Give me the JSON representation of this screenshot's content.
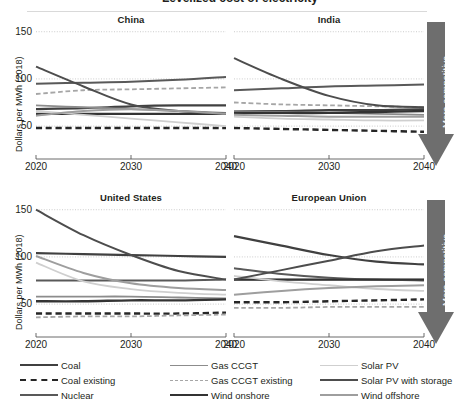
{
  "figure": {
    "partial_top_title": "Levelized cost of electricity",
    "ylabel": "Dollars per MWh (2018)",
    "arrow_label": "More competitive",
    "arrow_color": "#6e6e6e",
    "panel_titles": [
      "China",
      "India",
      "United States",
      "European Union"
    ]
  },
  "axes": {
    "ytick_labels": [
      "150",
      "100",
      "50"
    ],
    "yticks": [
      150,
      100,
      50
    ],
    "ylim": [
      30,
      155
    ],
    "xtick_labels": [
      "2020",
      "2030",
      "2040"
    ],
    "xticks": [
      2020,
      2030,
      2040
    ],
    "xlim": [
      2020,
      2040
    ]
  },
  "legend": {
    "columns": [
      [
        {
          "label": "Coal",
          "color": "#404040",
          "dash": false,
          "width": 2.2
        },
        {
          "label": "Coal existing",
          "color": "#262626",
          "dash": true,
          "width": 2.4
        },
        {
          "label": "Nuclear",
          "color": "#595959",
          "dash": false,
          "width": 2.0
        }
      ],
      [
        {
          "label": "Gas CCGT",
          "color": "#8c8c8c",
          "dash": false,
          "width": 1.8
        },
        {
          "label": "Gas CCGT existing",
          "color": "#a6a6a6",
          "dash": true,
          "width": 1.8
        },
        {
          "label": "Wind onshore",
          "color": "#333333",
          "dash": false,
          "width": 2.4
        }
      ],
      [
        {
          "label": "Solar PV",
          "color": "#cfcfcf",
          "dash": false,
          "width": 1.8
        },
        {
          "label": "Solar PV with storage",
          "color": "#4d4d4d",
          "dash": false,
          "width": 2.0
        },
        {
          "label": "Wind offshore",
          "color": "#9e9e9e",
          "dash": false,
          "width": 2.0
        }
      ]
    ]
  },
  "chart_data": {
    "type": "line",
    "xlabel": "",
    "ylabel": "Dollars per MWh (2018)",
    "x": [
      2020,
      2025,
      2030,
      2035,
      2040
    ],
    "xlim": [
      2020,
      2040
    ],
    "ylim": [
      30,
      155
    ],
    "yticks": [
      50,
      100,
      150
    ],
    "grid": "horizontal-dotted",
    "legend_position": "bottom",
    "annotation": "More competitive (downward arrow at right of each panel row)",
    "panels": [
      {
        "name": "China",
        "series": [
          {
            "name": "Coal",
            "color": "#404040",
            "dash": false,
            "values": [
              68,
              69,
              71,
              72,
              72
            ]
          },
          {
            "name": "Coal existing",
            "color": "#262626",
            "dash": true,
            "values": [
              48,
              48,
              48,
              48,
              48
            ]
          },
          {
            "name": "Nuclear",
            "color": "#595959",
            "dash": false,
            "values": [
              95,
              96,
              97,
              99,
              102
            ]
          },
          {
            "name": "Gas CCGT",
            "color": "#8c8c8c",
            "dash": false,
            "values": [
              72,
              70,
              68,
              66,
              64
            ]
          },
          {
            "name": "Gas CCGT existing",
            "color": "#a6a6a6",
            "dash": true,
            "values": [
              84,
              88,
              89,
              90,
              91
            ]
          },
          {
            "name": "Wind onshore",
            "color": "#333333",
            "dash": false,
            "values": [
              63,
              63,
              63,
              63,
              63
            ]
          },
          {
            "name": "Solar PV",
            "color": "#cfcfcf",
            "dash": false,
            "values": [
              66,
              62,
              58,
              54,
              50
            ]
          },
          {
            "name": "Solar PV with storage",
            "color": "#4d4d4d",
            "dash": false,
            "values": [
              113,
              92,
              73,
              66,
              63
            ]
          },
          {
            "name": "Wind offshore",
            "color": "#9e9e9e",
            "dash": false,
            "values": [
              61,
              66,
              68,
              66,
              63
            ]
          }
        ]
      },
      {
        "name": "India",
        "series": [
          {
            "name": "Coal",
            "color": "#404040",
            "dash": false,
            "values": [
              66,
              66,
              67,
              67,
              68
            ]
          },
          {
            "name": "Coal existing",
            "color": "#262626",
            "dash": true,
            "values": [
              48,
              47,
              46,
              45,
              44
            ]
          },
          {
            "name": "Nuclear",
            "color": "#595959",
            "dash": false,
            "values": [
              88,
              90,
              92,
              93,
              94
            ]
          },
          {
            "name": "Gas CCGT",
            "color": "#8c8c8c",
            "dash": false,
            "values": [
              66,
              65,
              64,
              63,
              62
            ]
          },
          {
            "name": "Gas CCGT existing",
            "color": "#a6a6a6",
            "dash": true,
            "values": [
              75,
              73,
              72,
              71,
              70
            ]
          },
          {
            "name": "Wind onshore",
            "color": "#333333",
            "dash": false,
            "values": [
              64,
              64,
              64,
              65,
              66
            ]
          },
          {
            "name": "Solar PV",
            "color": "#cfcfcf",
            "dash": false,
            "values": [
              60,
              58,
              57,
              56,
              56
            ]
          },
          {
            "name": "Solar PV with storage",
            "color": "#4d4d4d",
            "dash": false,
            "values": [
              122,
              100,
              82,
              72,
              70
            ]
          },
          {
            "name": "Wind offshore",
            "color": "#9e9e9e",
            "dash": false,
            "values": [
              62,
              61,
              60,
              60,
              60
            ]
          }
        ]
      },
      {
        "name": "United States",
        "series": [
          {
            "name": "Coal",
            "color": "#404040",
            "dash": false,
            "values": [
              104,
              103,
              102,
              101,
              100
            ]
          },
          {
            "name": "Coal existing",
            "color": "#262626",
            "dash": true,
            "values": [
              40,
              40,
              40,
              40,
              41
            ]
          },
          {
            "name": "Nuclear",
            "color": "#595959",
            "dash": false,
            "values": [
              75,
              75,
              75,
              75,
              76
            ]
          },
          {
            "name": "Gas CCGT",
            "color": "#8c8c8c",
            "dash": false,
            "values": [
              58,
              58,
              58,
              57,
              56
            ]
          },
          {
            "name": "Gas CCGT existing",
            "color": "#a6a6a6",
            "dash": true,
            "values": [
              36,
              37,
              37,
              38,
              39
            ]
          },
          {
            "name": "Wind onshore",
            "color": "#333333",
            "dash": false,
            "values": [
              53,
              53,
              54,
              54,
              55
            ]
          },
          {
            "name": "Solar PV",
            "color": "#cfcfcf",
            "dash": false,
            "values": [
              94,
              74,
              66,
              62,
              60
            ]
          },
          {
            "name": "Solar PV with storage",
            "color": "#4d4d4d",
            "dash": false,
            "values": [
              150,
              123,
              102,
              85,
              76
            ]
          },
          {
            "name": "Wind offshore",
            "color": "#9e9e9e",
            "dash": false,
            "values": [
              101,
              83,
              72,
              67,
              65
            ]
          }
        ]
      },
      {
        "name": "European Union",
        "series": [
          {
            "name": "Coal",
            "color": "#404040",
            "dash": false,
            "values": [
              122,
              112,
              102,
              95,
              92
            ]
          },
          {
            "name": "Coal existing",
            "color": "#262626",
            "dash": true,
            "values": [
              52,
              52,
              53,
              54,
              55
            ]
          },
          {
            "name": "Nuclear",
            "color": "#595959",
            "dash": false,
            "values": [
              88,
              82,
              78,
              76,
              75
            ]
          },
          {
            "name": "Gas CCGT",
            "color": "#8c8c8c",
            "dash": false,
            "values": [
              76,
              76,
              76,
              76,
              76
            ]
          },
          {
            "name": "Gas CCGT existing",
            "color": "#a6a6a6",
            "dash": true,
            "values": [
              46,
              46,
              47,
              47,
              47
            ]
          },
          {
            "name": "Wind onshore",
            "color": "#333333",
            "dash": false,
            "values": [
              76,
              76,
              76,
              76,
              76
            ]
          },
          {
            "name": "Solar PV",
            "color": "#cfcfcf",
            "dash": false,
            "values": [
              80,
              74,
              70,
              66,
              64
            ]
          },
          {
            "name": "Solar PV with storage",
            "color": "#4d4d4d",
            "dash": false,
            "values": [
              76,
              86,
              96,
              106,
              112
            ]
          },
          {
            "name": "Wind offshore",
            "color": "#9e9e9e",
            "dash": false,
            "values": [
              60,
              64,
              67,
              69,
              70
            ]
          }
        ]
      }
    ]
  }
}
